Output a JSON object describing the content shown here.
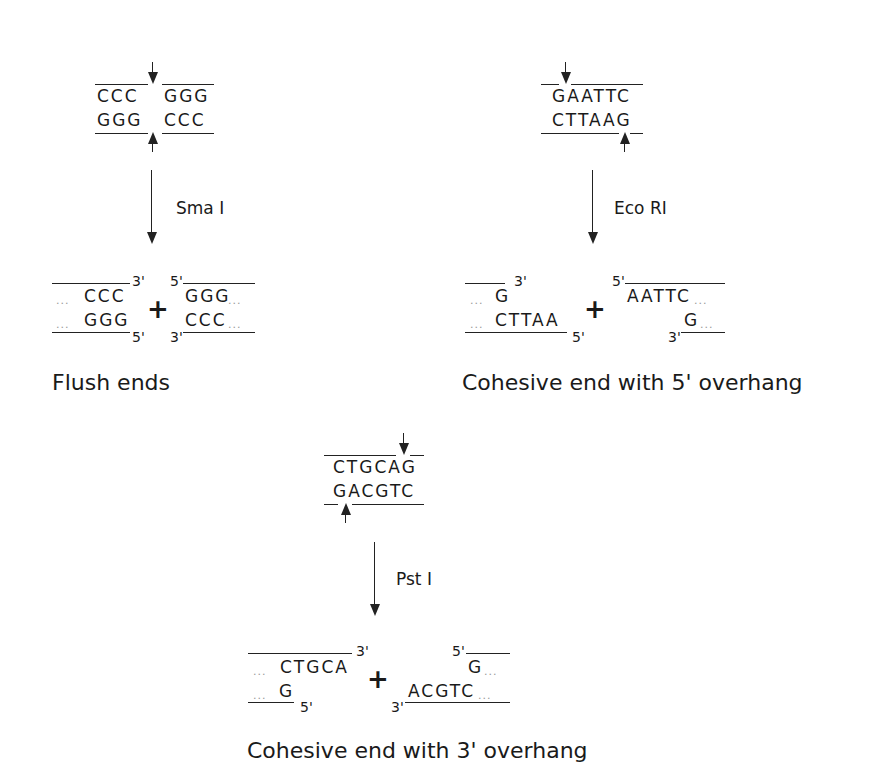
{
  "panels": [
    {
      "id": "smai",
      "enzyme": "Sma I",
      "site_top": [
        "CCC",
        "GGG"
      ],
      "site_bottom": [
        "GGG",
        "CCC"
      ],
      "product_left_top": "CCC",
      "product_left_bottom": "GGG",
      "product_right_top": "GGG",
      "product_right_bottom": "CCC",
      "caption": "Flush ends"
    },
    {
      "id": "ecori",
      "enzyme": "Eco RI",
      "site_top": "GAATTC",
      "site_bottom": "CTTAAG",
      "product_left_top": "G",
      "product_left_bottom": "CTTAA",
      "product_right_top": "AATTC",
      "product_right_bottom": "G",
      "caption": "Cohesive end with 5' overhang"
    },
    {
      "id": "psti",
      "enzyme": "Pst I",
      "site_top": "CTGCAG",
      "site_bottom": "GACGTC",
      "product_left_top": "CTGCA",
      "product_left_bottom": "G",
      "product_right_top": "G",
      "product_right_bottom": "ACGTC",
      "caption": "Cohesive end with 3' overhang"
    }
  ],
  "labels": {
    "three_prime": "3'",
    "five_prime": "5'",
    "plus": "+",
    "dots": "..."
  }
}
